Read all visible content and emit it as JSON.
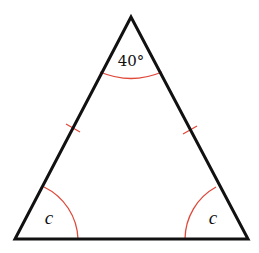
{
  "diagram": {
    "type": "isosceles-triangle",
    "apex_angle_label": "40°",
    "base_left_angle_label": "c",
    "base_right_angle_label": "c",
    "equal_sides_marked": [
      "left",
      "right"
    ],
    "colors": {
      "edges": "#111111",
      "angle_arcs": "#e0483a",
      "tick_marks": "#e0483a",
      "background": "#ffffff"
    }
  }
}
